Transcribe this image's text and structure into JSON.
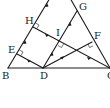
{
  "diagram": {
    "type": "geometry",
    "points": {
      "B": {
        "label": "B",
        "x": 8,
        "y": 68
      },
      "C": {
        "label": "C",
        "x": 109,
        "y": 68
      },
      "D": {
        "label": "D",
        "x": 43,
        "y": 68
      },
      "E": {
        "label": "E",
        "x": 17,
        "y": 54
      },
      "H": {
        "label": "H",
        "x": 33,
        "y": 27
      },
      "G": {
        "label": "G",
        "x": 77,
        "y": 11
      },
      "F": {
        "label": "F",
        "x": 92,
        "y": 42
      },
      "I": {
        "label": "I",
        "x": 60,
        "y": 42
      }
    },
    "labels": {
      "B": "B",
      "C": "C",
      "D": "D",
      "E": "E",
      "H": "H",
      "G": "G",
      "F": "F",
      "I": "I"
    },
    "segments": [
      {
        "from": "B",
        "to": "C",
        "name": "base-bc"
      },
      {
        "from": "B",
        "to": "A",
        "name": "side-ab"
      },
      {
        "from": "C",
        "to": "A",
        "name": "side-ac"
      },
      {
        "from": "E",
        "to": "D",
        "name": "segment-ed"
      },
      {
        "from": "H",
        "to": "C",
        "name": "segment-hc"
      },
      {
        "from": "D",
        "to": "G",
        "name": "segment-dg"
      },
      {
        "from": "D",
        "to": "F",
        "name": "segment-df"
      }
    ],
    "right_angles": [
      "E",
      "H",
      "I",
      "F"
    ],
    "colors": {
      "line": "#1a1a1a",
      "background": "#ffffff"
    }
  }
}
